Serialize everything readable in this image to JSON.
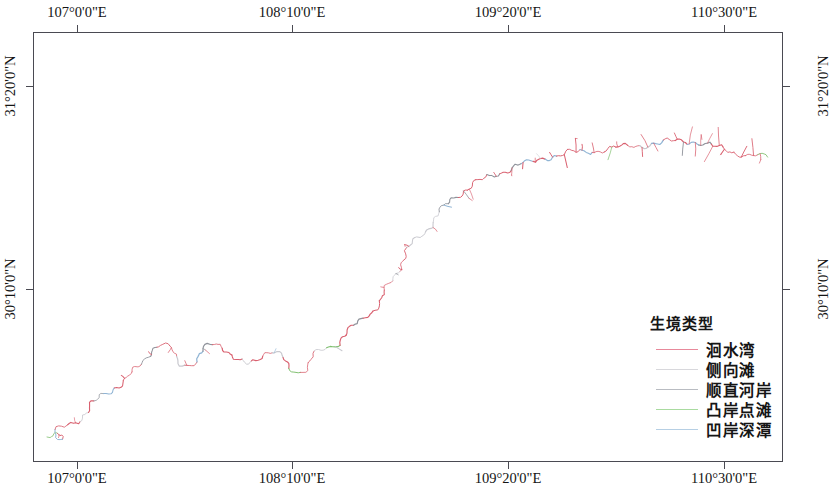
{
  "figure": {
    "type": "map",
    "background_color": "#ffffff",
    "frame_color": "#4a4a52"
  },
  "axes": {
    "top_labels": [
      "107°0'0\"E",
      "108°10'0\"E",
      "109°20'0\"E",
      "110°30'0\"E"
    ],
    "bottom_labels": [
      "107°0'0\"E",
      "108°10'0\"E",
      "109°20'0\"E",
      "110°30'0\"E"
    ],
    "left_labels": [
      "31°20'0\"N",
      "30°10'0\"N"
    ],
    "right_labels": [
      "31°20'0\"N",
      "30°10'0\"N"
    ],
    "x_tick_positions_px": [
      77,
      292,
      508,
      724
    ],
    "y_tick_positions_px": [
      86,
      289
    ],
    "x_label_positions_px": [
      77,
      292,
      508,
      724
    ],
    "y_label_positions_px": [
      86,
      289
    ]
  },
  "legend": {
    "title": "生境类型",
    "items": [
      {
        "label": "洄水湾",
        "color": "#e8899b"
      },
      {
        "label": "侧向滩",
        "color": "#d8d8dc"
      },
      {
        "label": "顺直河岸",
        "color": "#b9bcc2"
      },
      {
        "label": "凸岸点滩",
        "color": "#a9dba0"
      },
      {
        "label": "凹岸深潭",
        "color": "#b6cfe4"
      }
    ]
  },
  "chart_data": {
    "type": "line",
    "title": "",
    "xlabel": "",
    "ylabel": "",
    "river_colors": {
      "huishuiwan": "#d9606f",
      "cexiangtan": "#c9c9cf",
      "shunzhihean": "#8f939b",
      "tuandiantan": "#7fbf6f",
      "aoanshentan": "#8fb4d4"
    },
    "mainstem_path": "M 47,437 C 52,432 58,430 63,433 C 66,436 62,440 58,438 C 54,436 57,430 63,427 C 70,424 78,420 84,414 C 90,408 95,402 101,397 C 108,391 114,388 120,384 C 126,380 131,375 136,370 C 141,365 144,358 149,352 C 154,346 160,344 166,347 C 172,350 175,358 180,362 C 185,366 191,365 196,361 C 201,357 203,350 208,346 C 213,342 219,343 224,347 C 229,351 232,357 237,361 C 242,365 248,365 253,362 C 258,359 261,354 266,352 C 271,350 276,352 280,356 C 284,360 286,366 290,369 C 295,373 301,372 305,368 C 309,364 311,358 316,354 C 321,350 327,350 332,347 C 337,344 340,338 345,333 C 350,328 357,325 363,320 C 369,315 374,309 379,302 C 384,295 388,288 392,281 C 396,274 399,266 403,259 C 407,252 411,246 416,240 C 421,234 427,229 432,223 C 437,217 441,211 446,205 C 451,199 457,195 463,191 C 469,187 475,184 481,181 C 487,178 493,176 499,173 C 505,170 511,168 517,166 C 523,164 529,163 535,161 C 541,159 547,157 553,156 C 559,155 565,154 571,153 C 577,152 583,152 589,151 C 595,150 601,150 607,149 C 613,148 619,148 625,147 C 631,146 637,146 643,145 C 649,144 655,144 661,143 C 667,142 673,142 679,141 C 685,140 691,141 697,142 C 703,143 709,145 715,147 C 721,149 727,151 733,152 C 739,153 745,154 751,155 C 757,156 763,157 769,158",
    "rivers_rendered_as": "multi-colored polyline with tributary branches"
  }
}
